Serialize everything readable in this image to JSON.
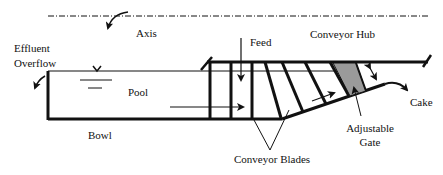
{
  "diagram": {
    "type": "decanter-centrifuge-cross-section",
    "labels": {
      "axis": "Axis",
      "effluent_line1": "Effluent",
      "effluent_line2": "Overflow",
      "pool": "Pool",
      "bowl": "Bowl",
      "feed": "Feed",
      "conveyor_hub": "Conveyor Hub",
      "cake": "Cake",
      "adjustable_gate_line1": "Adjustable",
      "adjustable_gate_line2": "Gate",
      "conveyor_blades": "Conveyor Blades"
    },
    "colors": {
      "line": "#111111",
      "gate_fill": "#9a9a9a",
      "background": "#ffffff"
    }
  }
}
